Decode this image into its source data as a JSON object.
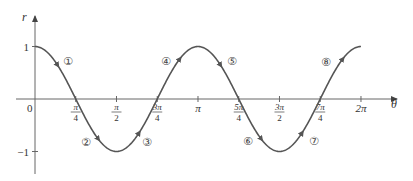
{
  "chart_data": {
    "type": "line",
    "title": "",
    "function": "r = cos 2θ",
    "xlabel": "θ",
    "ylabel": "r",
    "xlim": [
      0,
      6.2832
    ],
    "ylim": [
      -1,
      1
    ],
    "grid": false,
    "legend": null,
    "x_ticks": [
      {
        "value": 0.7854,
        "label_num": "π",
        "label_den": "4"
      },
      {
        "value": 1.5708,
        "label_num": "π",
        "label_den": "2"
      },
      {
        "value": 2.3562,
        "label_num": "3π",
        "label_den": "4"
      },
      {
        "value": 3.1416,
        "label": "π"
      },
      {
        "value": 3.927,
        "label_num": "5π",
        "label_den": "4"
      },
      {
        "value": 4.7124,
        "label_num": "3π",
        "label_den": "2"
      },
      {
        "value": 5.4978,
        "label_num": "7π",
        "label_den": "4"
      },
      {
        "value": 6.2832,
        "label": "2π"
      }
    ],
    "y_ticks": [
      {
        "value": 1,
        "label": "1"
      },
      {
        "value": -1,
        "label": "−1"
      }
    ],
    "origin_label": "0",
    "x": [
      0,
      0.3927,
      0.7854,
      1.1781,
      1.5708,
      1.9635,
      2.3562,
      2.7489,
      3.1416,
      3.5343,
      3.927,
      4.3197,
      4.7124,
      5.1051,
      5.4978,
      5.8905,
      6.2832
    ],
    "series": [
      {
        "name": "r = cos 2θ",
        "values": [
          1,
          0.707,
          0,
          -0.707,
          -1,
          -0.707,
          0,
          0.707,
          1,
          0.707,
          0,
          -0.707,
          -1,
          -0.707,
          0,
          0.707,
          1
        ],
        "color": "#555555"
      }
    ],
    "annotations": [
      {
        "text": "①",
        "segment": "0 to π/4",
        "px": [
          68,
          61
        ]
      },
      {
        "text": "②",
        "segment": "π/4 to π/2",
        "px": [
          86,
          142
        ]
      },
      {
        "text": "③",
        "segment": "π/2 to 3π/4",
        "px": [
          147,
          142
        ]
      },
      {
        "text": "④",
        "segment": "3π/4 to π",
        "px": [
          166,
          61
        ]
      },
      {
        "text": "⑤",
        "segment": "π to 5π/4",
        "px": [
          232,
          61
        ]
      },
      {
        "text": "⑥",
        "segment": "5π/4 to 3π/2",
        "px": [
          248,
          141
        ]
      },
      {
        "text": "⑦",
        "segment": "3π/2 to 7π/4",
        "px": [
          314,
          141
        ]
      },
      {
        "text": "⑧",
        "segment": "7π/4 to 2π",
        "px": [
          326,
          62
        ]
      }
    ]
  },
  "layout": {
    "origin_px": [
      35,
      99
    ],
    "x_scale_px_per_rad": 51.88,
    "y_scale_px_per_unit": 52.5,
    "axis_color": "#666666",
    "curve_color": "#555555"
  }
}
